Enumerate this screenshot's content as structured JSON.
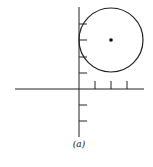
{
  "figure": {
    "caption": "(a)",
    "axes": {
      "origin": [
        79,
        89
      ],
      "x_axis": {
        "from": 15,
        "to": 144,
        "ticks": [
          95,
          111,
          127
        ]
      },
      "y_axis": {
        "from": 7,
        "to": 137,
        "ticks": [
          24,
          40,
          57,
          73,
          105,
          121
        ]
      },
      "tick_length": 8,
      "unit_px": 16
    },
    "circle": {
      "center": [
        111,
        40
      ],
      "radius": 32,
      "center_units": [
        2,
        3
      ],
      "radius_units": 2
    },
    "stroke_color": "#222222"
  }
}
